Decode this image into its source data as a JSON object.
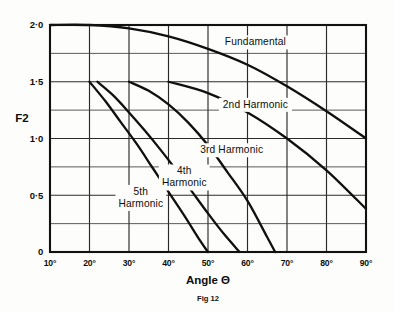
{
  "figure": {
    "caption": "Fig 12",
    "y_axis_title": "F2",
    "x_axis_title": "Angle Θ"
  },
  "chart_data": {
    "type": "line",
    "title": "",
    "subtitle": "",
    "caption": "Fig 12",
    "xlabel": "Angle Θ",
    "ylabel": "F2",
    "xlim": [
      10,
      90
    ],
    "ylim": [
      0,
      2.0
    ],
    "x_unit": "degrees",
    "grid": true,
    "grid_major_x_step": 10,
    "grid_major_y_step": 0.5,
    "grid_minor_y_step": 0.25,
    "legend_position": "inline-annotations",
    "x_tick_labels": [
      "10°",
      "20°",
      "30°",
      "40°",
      "50°",
      "60°",
      "70°",
      "80°",
      "90°"
    ],
    "x_ticks": [
      10,
      20,
      30,
      40,
      50,
      60,
      70,
      80,
      90
    ],
    "y_tick_labels": [
      "0",
      "0·5",
      "1·0",
      "1·5",
      "2·0"
    ],
    "y_ticks": [
      0,
      0.5,
      1.0,
      1.5,
      2.0
    ],
    "y_minor_ticks": [
      0.25,
      0.75,
      1.25,
      1.75
    ],
    "series": [
      {
        "name": "Fundamental",
        "label": "Fundamental",
        "label_x": 62,
        "label_y": 1.82,
        "x": [
          10,
          20,
          30,
          40,
          50,
          60,
          70,
          80,
          90
        ],
        "values": [
          2.0,
          2.0,
          1.97,
          1.9,
          1.79,
          1.65,
          1.46,
          1.24,
          1.0
        ]
      },
      {
        "name": "2nd Harmonic",
        "label": "2nd Harmonic",
        "label_x": 62,
        "label_y": 1.27,
        "x": [
          40,
          50,
          60,
          70,
          80,
          90
        ],
        "values": [
          1.5,
          1.4,
          1.23,
          1.0,
          0.72,
          0.38
        ]
      },
      {
        "name": "3rd Harmonic",
        "label": "3rd Harmonic",
        "label_x": 56,
        "label_y": 0.87,
        "x": [
          30,
          35,
          40,
          45,
          50,
          55,
          60,
          65,
          67
        ],
        "values": [
          1.5,
          1.42,
          1.3,
          1.14,
          0.94,
          0.7,
          0.45,
          0.13,
          0.0
        ]
      },
      {
        "name": "4th Harmonic",
        "label": "4th Harmonic",
        "label_x": 44,
        "label_y": 0.63,
        "x": [
          22,
          26,
          30,
          34,
          38,
          42,
          46,
          50,
          54,
          58
        ],
        "values": [
          1.5,
          1.38,
          1.23,
          1.07,
          0.9,
          0.72,
          0.53,
          0.34,
          0.16,
          0.0
        ]
      },
      {
        "name": "5th Harmonic",
        "label": "5th Harmonic",
        "label_x": 33,
        "label_y": 0.45,
        "x": [
          20,
          24,
          28,
          32,
          36,
          40,
          44,
          48,
          50
        ],
        "values": [
          1.5,
          1.33,
          1.14,
          0.95,
          0.74,
          0.53,
          0.32,
          0.1,
          0.0
        ]
      }
    ]
  }
}
